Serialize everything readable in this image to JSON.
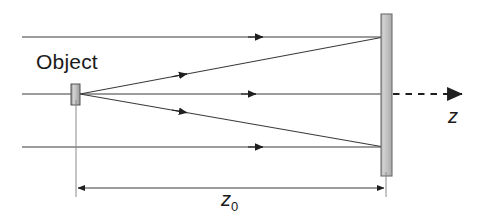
{
  "figure": {
    "type": "optics-ray-diagram",
    "title": "",
    "background_color": "#ffffff",
    "line_color": "#3a3a3a",
    "object_fill": "#b9b9b9",
    "screen_fill": "#c6c6c6",
    "screen_stroke": "#6e6e6e"
  },
  "labels": {
    "object": "Object",
    "distance": "z",
    "distance_subscript": "0",
    "axis": "z"
  },
  "geometry": {
    "object_x": 76,
    "object_y": 94,
    "screen_x": 386,
    "axis_y": 94,
    "top_ray_y": 37,
    "bottom_ray_y": 147,
    "dimension_y": 188,
    "dim_start_x": 76,
    "dim_end_x": 385,
    "dashed_axis_start_x": 392,
    "dashed_axis_end_x": 470
  },
  "elements": {
    "incoming_rays": [
      {
        "name": "top-incoming-ray",
        "y": 37,
        "x1": 22,
        "x2": 386,
        "arrow_at_x": 262
      },
      {
        "name": "middle-incoming-ray",
        "y": 94,
        "x1": 22,
        "x2": 76,
        "arrow_at_x": 0
      },
      {
        "name": "bottom-incoming-ray",
        "y": 147,
        "x1": 22,
        "x2": 386,
        "arrow_at_x": 262
      }
    ],
    "diffracted_rays": [
      {
        "name": "upper-diffracted-ray",
        "from": [
          80,
          94
        ],
        "to": [
          386,
          37
        ],
        "arrow_at_x": 200
      },
      {
        "name": "axial-diffracted-ray",
        "from": [
          80,
          94
        ],
        "to": [
          386,
          94
        ],
        "arrow_at_x": 255
      },
      {
        "name": "lower-diffracted-ray",
        "from": [
          80,
          94
        ],
        "to": [
          386,
          147
        ],
        "arrow_at_x": 200
      }
    ],
    "object_marker": {
      "name": "object-rect",
      "x": 71,
      "y": 84,
      "width": 9,
      "height": 21
    },
    "screen": {
      "name": "observation-screen",
      "x": 381,
      "y": 14,
      "width": 11,
      "height": 162
    },
    "extension_lines": [
      {
        "name": "left-extension-line",
        "x": 76,
        "y1": 100,
        "y2": 196
      },
      {
        "name": "right-extension-line",
        "x": 386,
        "y1": 176,
        "y2": 196
      }
    ]
  }
}
